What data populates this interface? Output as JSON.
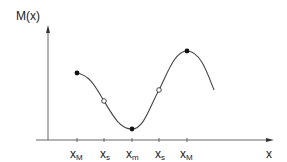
{
  "diagram": {
    "y_axis_label": "M(x)",
    "x_axis_label": "x",
    "tick_labels": [
      {
        "base": "x",
        "sub": "M"
      },
      {
        "base": "x",
        "sub": "s"
      },
      {
        "base": "x",
        "sub": "m"
      },
      {
        "base": "x",
        "sub": "s"
      },
      {
        "base": "x",
        "sub": "M"
      }
    ],
    "points": [
      {
        "kind": "filled",
        "meaning": "local maximum"
      },
      {
        "kind": "open",
        "meaning": "inflection"
      },
      {
        "kind": "filled",
        "meaning": "local minimum"
      },
      {
        "kind": "open",
        "meaning": "inflection"
      },
      {
        "kind": "filled",
        "meaning": "local maximum"
      }
    ],
    "colors": {
      "axis": "#555555",
      "curve": "#444444",
      "point": "#111111"
    }
  }
}
